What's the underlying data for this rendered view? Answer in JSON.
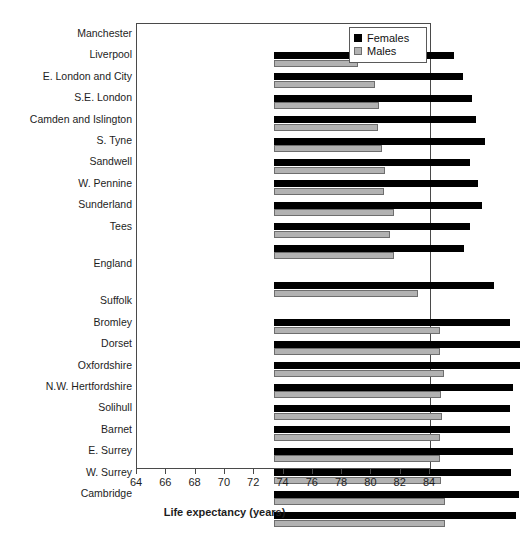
{
  "chart_data": {
    "type": "bar",
    "orientation": "horizontal",
    "title": "",
    "xlabel": "Life expectancy (years)",
    "ylabel": "",
    "xlim": [
      64,
      84
    ],
    "xticks": [
      64,
      66,
      68,
      70,
      72,
      74,
      76,
      78,
      80,
      82,
      84
    ],
    "grid": false,
    "legend_position": "top-right",
    "categories": [
      "Manchester",
      "Liverpool",
      "E. London and City",
      "S.E. London",
      "Camden and Islington",
      "S. Tyne",
      "Sandwell",
      "W. Pennine",
      "Sunderland",
      "Tees",
      "England",
      "Suffolk",
      "Bromley",
      "Dorset",
      "Oxfordshire",
      "N.W. Hertfordshire",
      "Solihull",
      "Barnet",
      "E. Surrey",
      "W. Surrey",
      "Cambridge"
    ],
    "series": [
      {
        "name": "Females",
        "color": "#000000",
        "values": [
          76.3,
          76.9,
          77.5,
          77.8,
          78.4,
          77.4,
          77.9,
          78.2,
          77.4,
          77.0,
          79.0,
          80.1,
          80.8,
          80.8,
          80.3,
          80.1,
          80.1,
          80.3,
          80.2,
          80.7,
          80.5
        ]
      },
      {
        "name": "Males",
        "color": "#b2b2b2",
        "values": [
          69.7,
          70.9,
          71.2,
          71.1,
          71.4,
          71.6,
          71.5,
          72.2,
          71.9,
          72.2,
          73.8,
          75.3,
          75.3,
          75.6,
          75.4,
          75.5,
          75.3,
          75.3,
          75.4,
          75.7,
          75.7
        ]
      }
    ]
  },
  "legend": {
    "items": [
      {
        "label": "Females",
        "swatch": "black-square-icon"
      },
      {
        "label": "Males",
        "swatch": "gray-square-icon"
      }
    ]
  },
  "axis": {
    "x_title": "Life expectancy (years)",
    "x_tick_labels": [
      "64",
      "66",
      "68",
      "70",
      "72",
      "74",
      "76",
      "78",
      "80",
      "82",
      "84"
    ]
  }
}
